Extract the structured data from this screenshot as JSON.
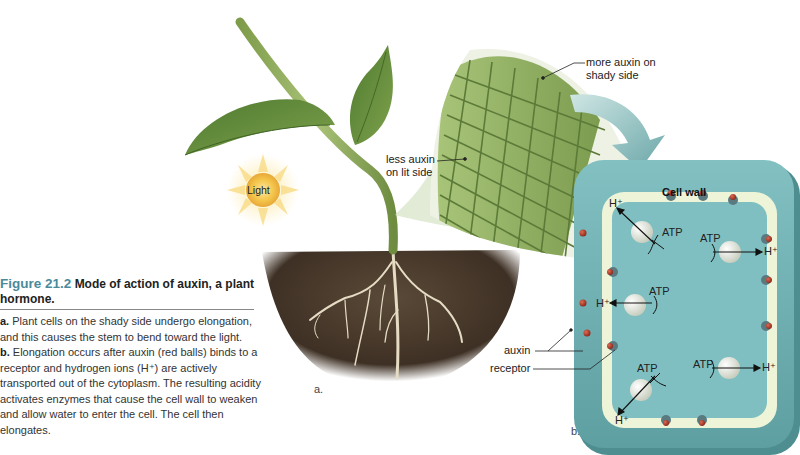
{
  "figure": {
    "number": "Figure 21.2",
    "title": "Mode of action of auxin, a plant hormone.",
    "caption": [
      {
        "marker": "a.",
        "text": "Plant cells on the shady side undergo elongation, and this causes the stem to bend toward the light."
      },
      {
        "marker": "b.",
        "text": "Elongation occurs after auxin (red balls) binds to a receptor and hydrogen ions (H⁺) are actively transported out of the cytoplasm. The resulting acidity activates enzymes that cause the cell wall to weaken and allow water to enter the cell. The cell then elongates."
      }
    ]
  },
  "panel_a": {
    "label": "a.",
    "light_label": "Light",
    "callouts": {
      "more_auxin": [
        "more auxin on",
        "shady side"
      ],
      "less_auxin": [
        "less auxin",
        "on lit side"
      ]
    }
  },
  "panel_b": {
    "label": "b.",
    "cell_wall": "Cell wall",
    "auxin": "auxin",
    "receptor": "receptor",
    "atp": "ATP",
    "h_ion": "H⁺"
  },
  "colors": {
    "caption_accent": "#4a8a9c",
    "leaf": "#5f8a3a",
    "stem": "#8fae5a",
    "soil": "#4a3a2c",
    "root": "#e6dcc4",
    "sun": "#f4c74c",
    "cell_wall": "#6fb0b4",
    "cell_inner": "#7dc0c2",
    "membrane": "#eef4d8",
    "auxin_ball": "#b43a2c",
    "receptor": "#5a7a80"
  }
}
